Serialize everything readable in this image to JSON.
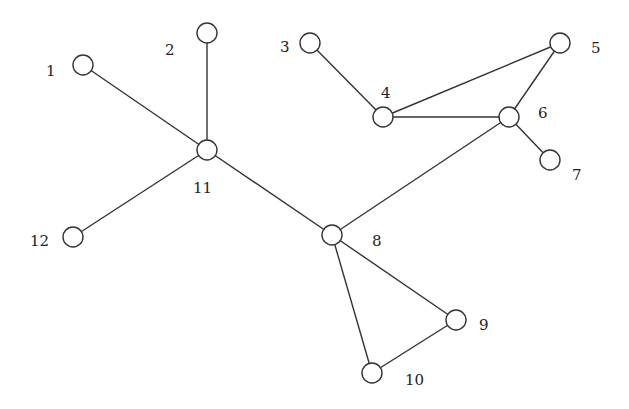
{
  "diagram": {
    "type": "undirected-graph",
    "node_radius": 10,
    "colors": {
      "stroke": "#333333",
      "fill": "#ffffff",
      "text": "#222222"
    },
    "nodes": [
      {
        "id": "1",
        "label": "1",
        "x": 83,
        "y": 65,
        "lx": 46,
        "ly": 76
      },
      {
        "id": "2",
        "label": "2",
        "x": 207,
        "y": 33,
        "lx": 165,
        "ly": 55
      },
      {
        "id": "3",
        "label": "3",
        "x": 310,
        "y": 43,
        "lx": 280,
        "ly": 52
      },
      {
        "id": "4",
        "label": "4",
        "x": 383,
        "y": 117,
        "lx": 381,
        "ly": 98
      },
      {
        "id": "5",
        "label": "5",
        "x": 560,
        "y": 43,
        "lx": 591,
        "ly": 53
      },
      {
        "id": "6",
        "label": "6",
        "x": 509,
        "y": 117,
        "lx": 538,
        "ly": 118
      },
      {
        "id": "7",
        "label": "7",
        "x": 550,
        "y": 160,
        "lx": 572,
        "ly": 180
      },
      {
        "id": "8",
        "label": "8",
        "x": 332,
        "y": 235,
        "lx": 372,
        "ly": 246
      },
      {
        "id": "9",
        "label": "9",
        "x": 456,
        "y": 320,
        "lx": 479,
        "ly": 330
      },
      {
        "id": "10",
        "label": "10",
        "x": 372,
        "y": 373,
        "lx": 405,
        "ly": 385
      },
      {
        "id": "11",
        "label": "11",
        "x": 207,
        "y": 150,
        "lx": 193,
        "ly": 193
      },
      {
        "id": "12",
        "label": "12",
        "x": 73,
        "y": 237,
        "lx": 30,
        "ly": 246
      }
    ],
    "edges": [
      [
        "1",
        "11"
      ],
      [
        "2",
        "11"
      ],
      [
        "12",
        "11"
      ],
      [
        "11",
        "8"
      ],
      [
        "3",
        "4"
      ],
      [
        "4",
        "5"
      ],
      [
        "4",
        "6"
      ],
      [
        "5",
        "6"
      ],
      [
        "6",
        "7"
      ],
      [
        "6",
        "8"
      ],
      [
        "8",
        "9"
      ],
      [
        "8",
        "10"
      ],
      [
        "9",
        "10"
      ]
    ]
  }
}
